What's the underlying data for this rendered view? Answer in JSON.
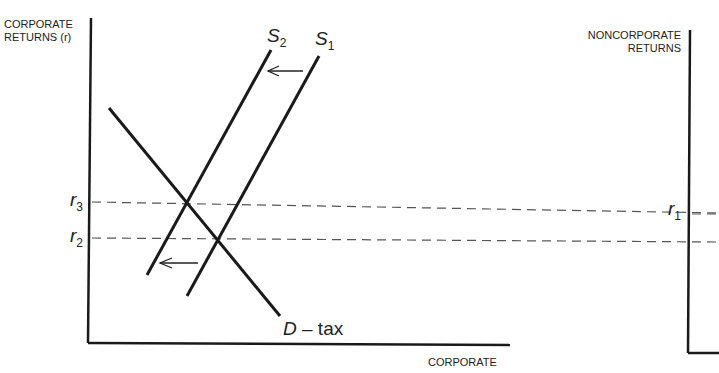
{
  "left_panel": {
    "y_axis_label_line1": "CORPORATE",
    "y_axis_label_line2": "RETURNS (r)",
    "x_axis_label": "CORPORATE",
    "curves": {
      "s2": {
        "name": "S",
        "sub": "2"
      },
      "s1": {
        "name": "S",
        "sub": "1"
      },
      "demand": {
        "name": "D",
        "suffix": " – tax"
      }
    },
    "levels": {
      "r3": {
        "name": "r",
        "sub": "3"
      },
      "r2": {
        "name": "r",
        "sub": "2"
      }
    }
  },
  "right_panel": {
    "y_axis_label_line1": "NONCORPORATE",
    "y_axis_label_line2": "RETURNS",
    "levels": {
      "r1": {
        "name": "r",
        "sub": "1"
      }
    }
  },
  "colors": {
    "line": "#1a1a1a",
    "dash": "#555555"
  }
}
